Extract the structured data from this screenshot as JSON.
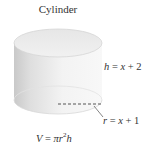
{
  "figure": {
    "title": "Cylinder",
    "labels": {
      "height": {
        "var": "h",
        "eq": "=",
        "expr_var": "x",
        "expr_rest": "+ 2"
      },
      "radius": {
        "var": "r",
        "eq": "=",
        "expr_var": "x",
        "expr_rest": "+ 1"
      },
      "volume": {
        "lhs": "V",
        "eq": "=",
        "pi": "π",
        "r": "r",
        "exp": "2",
        "h": "h"
      }
    },
    "colors": {
      "body_light": "#f2f2f2",
      "body_dark": "#cfcfcf",
      "top_face": "#ececec",
      "text": "#333333",
      "dashed_line": "#555555"
    },
    "icon": "cylinder-shape"
  }
}
